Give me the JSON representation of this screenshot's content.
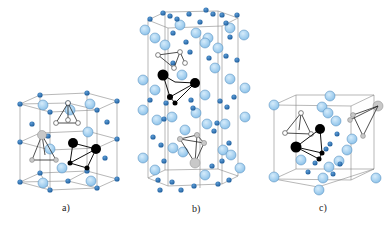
{
  "figure": {
    "panels": [
      {
        "id": "a",
        "label": "a)",
        "structure": "hexagonal unit cell with tetrahedral interstitial sites"
      },
      {
        "id": "b",
        "label": "b)",
        "structure": "tall hexagonal prism with tetrahedra"
      },
      {
        "id": "c",
        "label": "c)",
        "structure": "cubic unit cell with tetrahedral sites"
      }
    ],
    "colors": {
      "large_atom": "#a9d3f0",
      "large_atom_stroke": "#3d7fb5",
      "small_atom": "#2f73b6",
      "black_atom": "#000000",
      "white_atom": "#ffffff",
      "gray_atom": "#c4c4c4",
      "edge": "#777777"
    }
  }
}
